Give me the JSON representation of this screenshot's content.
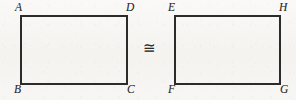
{
  "figure": {
    "type": "geometry-diagram",
    "background_color": "#f6f5f2",
    "stroke_color": "#2b2b2b",
    "label_color": "#2c2c2c",
    "relation": {
      "symbol": "≅",
      "name": "congruent-to",
      "x": 149,
      "y": 50
    },
    "shapes": [
      {
        "id": "rect-abcd",
        "name": "rectangle-abcd",
        "x": 21,
        "y": 16,
        "width": 106,
        "height": 68,
        "vertices": [
          {
            "label": "A",
            "position": "top-left",
            "lx": 15,
            "ly": 2
          },
          {
            "label": "D",
            "position": "top-right",
            "lx": 126,
            "ly": 2
          },
          {
            "label": "B",
            "position": "bottom-left",
            "lx": 14,
            "ly": 84
          },
          {
            "label": "C",
            "position": "bottom-right",
            "lx": 127,
            "ly": 84
          }
        ]
      },
      {
        "id": "rect-efgh",
        "name": "rectangle-efgh",
        "x": 175,
        "y": 16,
        "width": 105,
        "height": 68,
        "vertices": [
          {
            "label": "E",
            "position": "top-left",
            "lx": 168,
            "ly": 2
          },
          {
            "label": "H",
            "position": "top-right",
            "lx": 279,
            "ly": 2
          },
          {
            "label": "F",
            "position": "bottom-left",
            "lx": 168,
            "ly": 84
          },
          {
            "label": "G",
            "position": "bottom-right",
            "lx": 280,
            "ly": 84
          }
        ]
      }
    ]
  }
}
